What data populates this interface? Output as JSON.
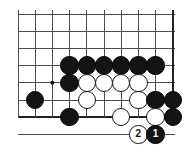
{
  "diagram": {
    "kind": "go-board-diagram",
    "board": {
      "origin_x": 18,
      "origin_y": 14,
      "spacing_x": 17.2,
      "spacing_y": 17.2,
      "cols": 10,
      "rows": 8,
      "line_color": "#4d4d4d",
      "edge_color": "#222222",
      "edge_width": 2.4,
      "line_width": 1.0,
      "background": "#ffffff",
      "stone_radius": 9.2,
      "star_points": [
        {
          "col": 3,
          "row": 5
        }
      ],
      "star_radius": 2.0,
      "star_color": "#111111",
      "bottom_edge_row": 7,
      "right_edge_col": 9
    },
    "stones": [
      {
        "id": "b1",
        "color": "black",
        "col": 4,
        "row": 4,
        "label": ""
      },
      {
        "id": "b2",
        "color": "black",
        "col": 5,
        "row": 4,
        "label": ""
      },
      {
        "id": "b3",
        "color": "black",
        "col": 6,
        "row": 4,
        "label": ""
      },
      {
        "id": "b4",
        "color": "black",
        "col": 7,
        "row": 4,
        "label": ""
      },
      {
        "id": "b5",
        "color": "black",
        "col": 8,
        "row": 4,
        "label": ""
      },
      {
        "id": "b6",
        "color": "black",
        "col": 9,
        "row": 4,
        "label": ""
      },
      {
        "id": "b7",
        "color": "black",
        "col": 4,
        "row": 5,
        "label": ""
      },
      {
        "id": "w1",
        "color": "white",
        "col": 5,
        "row": 5,
        "label": ""
      },
      {
        "id": "w2",
        "color": "white",
        "col": 6,
        "row": 5,
        "label": ""
      },
      {
        "id": "w3",
        "color": "white",
        "col": 7,
        "row": 5,
        "label": ""
      },
      {
        "id": "w4",
        "color": "white",
        "col": 8,
        "row": 5,
        "label": ""
      },
      {
        "id": "b8",
        "color": "black",
        "col": 2,
        "row": 6,
        "label": ""
      },
      {
        "id": "w5",
        "color": "white",
        "col": 5,
        "row": 6,
        "label": ""
      },
      {
        "id": "w6",
        "color": "white",
        "col": 8,
        "row": 6,
        "label": ""
      },
      {
        "id": "b9",
        "color": "black",
        "col": 9,
        "row": 6,
        "label": ""
      },
      {
        "id": "b10",
        "color": "black",
        "col": 10,
        "row": 6,
        "label": ""
      },
      {
        "id": "b11",
        "color": "black",
        "col": 4,
        "row": 7,
        "label": ""
      },
      {
        "id": "w7",
        "color": "white",
        "col": 7,
        "row": 7,
        "label": ""
      },
      {
        "id": "w8",
        "color": "white",
        "col": 9,
        "row": 7,
        "label": ""
      },
      {
        "id": "b12",
        "color": "black",
        "col": 10,
        "row": 7,
        "label": ""
      },
      {
        "id": "move2",
        "color": "white",
        "col": 8,
        "row": 8,
        "label": "2"
      },
      {
        "id": "move1",
        "color": "black",
        "col": 9,
        "row": 8,
        "label": "1"
      }
    ],
    "move_labels": {
      "move_1": "1",
      "move_2": "2"
    }
  }
}
